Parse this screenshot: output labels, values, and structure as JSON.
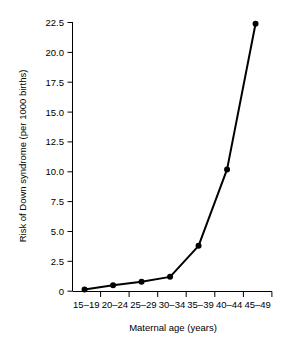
{
  "chart_data": {
    "type": "line",
    "title": "",
    "subtitle": "",
    "xlabel": "Maternal age (years)",
    "ylabel": "Risk of Down syndrome (per 1000 births)",
    "categories": [
      "15–19",
      "20–24",
      "25–29",
      "30–34",
      "35–39",
      "40–44",
      "45–49"
    ],
    "values": [
      0.15,
      0.5,
      0.8,
      1.2,
      3.8,
      10.2,
      22.4
    ],
    "series": [
      {
        "name": "Risk of Down syndrome (per 1000 births)",
        "values": [
          0.15,
          0.5,
          0.8,
          1.2,
          3.8,
          10.2,
          22.4
        ]
      }
    ],
    "ylim": [
      0,
      22.5
    ],
    "yticks": [
      0,
      2.5,
      5.0,
      7.5,
      10.0,
      12.5,
      15.0,
      17.5,
      20.0,
      22.5
    ],
    "ytick_labels": [
      "0",
      "2.5",
      "5.0",
      "7.5",
      "10.0",
      "12.5",
      "15.0",
      "17.5",
      "20.0",
      "22.5"
    ],
    "xtick_labels": [
      "15–19",
      "20–24",
      "25–29",
      "30–34",
      "35–39",
      "40–44",
      "45–49"
    ],
    "grid": false,
    "legend": false,
    "legend_position": "none",
    "marker": "filled-circle",
    "line_color": "#000000",
    "marker_color": "#000000",
    "background_color": "#ffffff",
    "annotations": []
  },
  "axis": {
    "y_title": "Risk of Down syndrome (per 1000 births)",
    "x_title": "Maternal age (years)"
  },
  "ticks": {
    "y": [
      {
        "label": "22.5",
        "value": 22.5
      },
      {
        "label": "20.0",
        "value": 20.0
      },
      {
        "label": "17.5",
        "value": 17.5
      },
      {
        "label": "15.0",
        "value": 15.0
      },
      {
        "label": "12.5",
        "value": 12.5
      },
      {
        "label": "10.0",
        "value": 10.0
      },
      {
        "label": "7.5",
        "value": 7.5
      },
      {
        "label": "5.0",
        "value": 5.0
      },
      {
        "label": "2.5",
        "value": 2.5
      },
      {
        "label": "0",
        "value": 0
      }
    ],
    "x": [
      {
        "label": "15–19",
        "value": 0.15
      },
      {
        "label": "20–24",
        "value": 0.5
      },
      {
        "label": "25–29",
        "value": 0.8
      },
      {
        "label": "30–34",
        "value": 1.2
      },
      {
        "label": "35–39",
        "value": 3.8
      },
      {
        "label": "40–44",
        "value": 10.2
      },
      {
        "label": "45–49",
        "value": 22.4
      }
    ]
  }
}
